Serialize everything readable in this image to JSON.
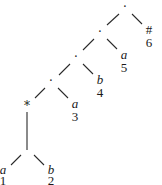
{
  "diagram": {
    "type": "binary-tree",
    "internal_nodes": [
      {
        "label": "·"
      },
      {
        "label": "·"
      },
      {
        "label": "·"
      },
      {
        "label": "·"
      },
      {
        "label": "*"
      }
    ],
    "leaves": [
      {
        "symbol": "a",
        "index": "1"
      },
      {
        "symbol": "b",
        "index": "2"
      },
      {
        "symbol": "a",
        "index": "3"
      },
      {
        "symbol": "b",
        "index": "4"
      },
      {
        "symbol": "a",
        "index": "5"
      },
      {
        "symbol": "#",
        "index": "6"
      }
    ],
    "colors": {
      "line": "#2a2a2a",
      "text": "#1a1a1a",
      "background": "#ffffff"
    }
  }
}
